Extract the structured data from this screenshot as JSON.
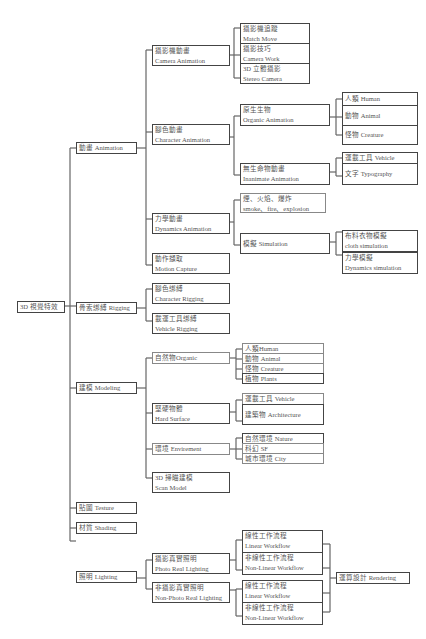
{
  "root": {
    "label": "3D 視覺特效"
  },
  "level1": [
    {
      "id": "animation",
      "label": "動畫 Animation"
    },
    {
      "id": "rigging",
      "label": "骨索綁縛 Rigging"
    },
    {
      "id": "modeling",
      "label": "建模 Modeling"
    },
    {
      "id": "texture",
      "label": "貼圖 Testure"
    },
    {
      "id": "shading",
      "label": "材質 Shading"
    },
    {
      "id": "lighting",
      "label": "照明 Lighting"
    }
  ],
  "animation": {
    "camera": {
      "zh": "攝影機動畫",
      "en": "Camera Animation",
      "children": [
        {
          "zh": "攝影機追蹤",
          "en": "Match Move"
        },
        {
          "zh": "攝影技巧",
          "en": "Camera Work"
        },
        {
          "zh": "3D 立體攝影",
          "en": "Stereo Camera"
        }
      ]
    },
    "character": {
      "zh": "腳色動畫",
      "en": "Character Animation",
      "organic": {
        "zh": "原生生物",
        "en": "Organic Animation",
        "children": [
          {
            "label": "人類 Human"
          },
          {
            "label": "動物 Animal"
          },
          {
            "label": "怪物 Creature"
          }
        ]
      },
      "inanimate": {
        "zh": "無生命物動畫",
        "en": "Inanimate Animation",
        "children": [
          {
            "label": "運載工具 Vehicle"
          },
          {
            "label": "文字 Typography"
          }
        ]
      }
    },
    "dynamics": {
      "zh": "力學動畫",
      "en": "Dynamics Animation",
      "smoke": {
        "zh": "煙、火焰、爆炸",
        "en": "smoke、fire、explosion"
      },
      "simulation": {
        "label": "模擬 Simulation",
        "children": [
          {
            "zh": "布料衣物模擬",
            "en": "cloth simulation"
          },
          {
            "zh": "力學模擬",
            "en": "Dynamics simulation"
          }
        ]
      }
    },
    "motion_capture": {
      "zh": "動作擷取",
      "en": "Motion Capture"
    }
  },
  "rigging": {
    "children": [
      {
        "zh": "腳色綁縛",
        "en": "Character Rigging"
      },
      {
        "zh": "載運工具綁縛",
        "en": "Vehicle Rigging"
      }
    ]
  },
  "modeling": {
    "organic": {
      "label": "自然物Organic",
      "children": [
        {
          "label": "人類Human"
        },
        {
          "label": "動物 Animal"
        },
        {
          "label": "怪物 Creature"
        },
        {
          "label": "植物 Plants"
        }
      ]
    },
    "hard_surface": {
      "zh": "堅硬物體",
      "en": "Hard Surface",
      "children": [
        {
          "label": "運載工具 Vehicle"
        },
        {
          "label": "建築物 Architecture"
        }
      ]
    },
    "environment": {
      "label": "環境 Envirement",
      "children": [
        {
          "label": "自然環境 Nature"
        },
        {
          "label": "科幻 SF"
        },
        {
          "label": "城市環境 City"
        }
      ]
    },
    "scan": {
      "zh": "3D 掃瞄建模",
      "en": "Scan Model"
    }
  },
  "lighting": {
    "photo_real": {
      "zh": "攝影真實照明",
      "en": "Photo Real Lighting",
      "children": [
        {
          "zh": "線性工作流程",
          "en": "Linear Workflow"
        },
        {
          "zh": "非線性工作流程",
          "en": "Non-Linear Workflow"
        }
      ]
    },
    "non_photo_real": {
      "zh": "非攝影真實照明",
      "en": "Non-Photo Real Lighting",
      "children": [
        {
          "zh": "線性工作流程",
          "en": "Linear Workflow"
        },
        {
          "zh": "非線性工作流程",
          "en": "Non-Linear Workflow"
        }
      ]
    },
    "rendering": {
      "label": "運算設計 Rendering"
    }
  },
  "colors": {
    "line": "#555555",
    "border": "#444444",
    "text": "#555555"
  }
}
